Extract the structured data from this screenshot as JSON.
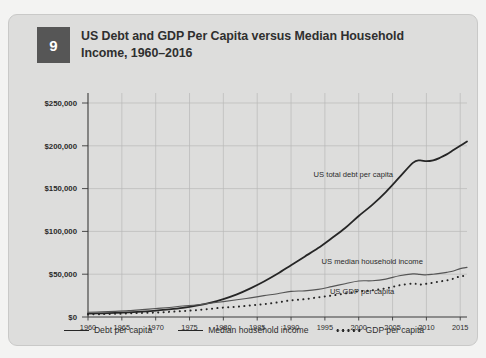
{
  "card": {
    "badge_number": "9",
    "title": "US Debt and GDP Per Capita versus Median Household Income, 1960–2016"
  },
  "legend": {
    "items": [
      {
        "label": "Debt per capita",
        "style": "solid"
      },
      {
        "label": "Median household income",
        "style": "solid"
      },
      {
        "label": "GDP per capita",
        "style": "dotted"
      }
    ]
  },
  "annotations": {
    "debt": "US total debt per capita",
    "income": "US median household income",
    "gdp": "US GDP per capita"
  },
  "colors": {
    "card_background": "#dddddc",
    "page_background": "#f3f3f2",
    "plot_background": "#f2f2f1",
    "badge": "#565656",
    "line": "#262626",
    "income_line": "#555555",
    "grid": "#b9b9b8",
    "text": "#2f2f2f"
  },
  "chart_data": {
    "type": "line",
    "title": "US Debt and GDP Per Capita versus Median Household Income, 1960–2016",
    "xlabel": "",
    "ylabel": "",
    "xlim": [
      1960,
      2016
    ],
    "ylim": [
      0,
      250000
    ],
    "ytick_labels": [
      "$0",
      "$50,000",
      "$100,000",
      "$150,000",
      "$200,000",
      "$250,000"
    ],
    "ytick_values": [
      0,
      50000,
      100000,
      150000,
      200000,
      250000
    ],
    "xtick_labels": [
      "1960",
      "1965",
      "1970",
      "1975",
      "1980",
      "1985",
      "1990",
      "1995",
      "2000",
      "2005",
      "2010",
      "2015"
    ],
    "xtick_values": [
      1960,
      1965,
      1970,
      1975,
      1980,
      1985,
      1990,
      1995,
      2000,
      2005,
      2010,
      2015
    ],
    "grid": true,
    "legend_position": "bottom",
    "x": [
      1960,
      1962,
      1964,
      1966,
      1968,
      1970,
      1972,
      1974,
      1976,
      1978,
      1980,
      1982,
      1984,
      1986,
      1988,
      1990,
      1992,
      1994,
      1996,
      1998,
      2000,
      2002,
      2004,
      2006,
      2008,
      2009,
      2010,
      2011,
      2012,
      2013,
      2014,
      2015,
      2016
    ],
    "series": [
      {
        "name": "Debt per capita",
        "style": "solid",
        "annotation": "US total debt per capita",
        "values": [
          3900,
          4300,
          4800,
          5400,
          6300,
          7400,
          8800,
          10600,
          13200,
          16600,
          21000,
          26500,
          33500,
          41500,
          50500,
          60500,
          70500,
          80500,
          92000,
          104000,
          118000,
          131000,
          146000,
          163000,
          180000,
          183000,
          182000,
          183000,
          186000,
          190000,
          195000,
          200000,
          205000
        ]
      },
      {
        "name": "Median household income",
        "style": "solid",
        "annotation": "US median household income",
        "values": [
          5600,
          6000,
          6600,
          7400,
          8600,
          9900,
          11100,
          12800,
          14000,
          16000,
          18000,
          20100,
          22400,
          24900,
          27200,
          29900,
          30600,
          32300,
          35500,
          38900,
          42100,
          42400,
          44300,
          48200,
          50300,
          49800,
          49300,
          50000,
          51000,
          52200,
          53700,
          56500,
          58000
        ]
      },
      {
        "name": "GDP per capita",
        "style": "dotted",
        "annotation": "US GDP per capita",
        "values": [
          3000,
          3300,
          3700,
          4200,
          4800,
          5200,
          6000,
          6900,
          8000,
          9500,
          11000,
          12000,
          13500,
          15000,
          17000,
          19500,
          20800,
          23000,
          25000,
          27500,
          30000,
          31200,
          33500,
          37000,
          39000,
          37800,
          38800,
          40000,
          41500,
          42800,
          44800,
          47500,
          48000
        ]
      }
    ]
  }
}
